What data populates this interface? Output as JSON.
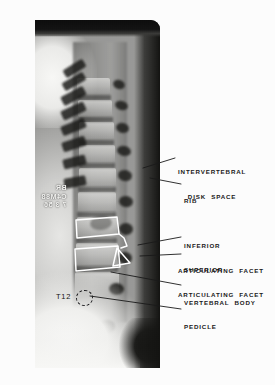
{
  "figure": {
    "type": "annotated-radiograph",
    "view": "lateral thoracolumbar spine",
    "film_stamp": "BR\nC4M88\n7 3 56",
    "on_film_markers": [
      {
        "name": "vertebra-level-marker",
        "text": "T12"
      }
    ],
    "annotations": [
      {
        "id": "intervertebral-disk-space",
        "lines": [
          "INTERVERTEBRAL",
          "DISK  SPACE"
        ],
        "align": "center",
        "text_x": 178,
        "text_y": 152,
        "leader": {
          "x1": 175,
          "y1": 158,
          "x2": 143,
          "y2": 168
        }
      },
      {
        "id": "rib",
        "lines": [
          "RIB"
        ],
        "align": "left",
        "text_x": 184,
        "text_y": 181,
        "leader": {
          "x1": 181,
          "y1": 184,
          "x2": 150,
          "y2": 178
        }
      },
      {
        "id": "inferior-articulating-facet",
        "lines": [
          "INFERIOR",
          "ARTICULATING  FACET"
        ],
        "align": "left",
        "text_x": 184,
        "text_y": 226,
        "leader": {
          "x1": 181,
          "y1": 237,
          "x2": 138,
          "y2": 245
        }
      },
      {
        "id": "superior-articulating-facet",
        "lines": [
          "SUPERIOR",
          "ARTICULATING  FACET"
        ],
        "align": "left",
        "text_x": 184,
        "text_y": 250,
        "leader": {
          "x1": 181,
          "y1": 254,
          "x2": 140,
          "y2": 256
        }
      },
      {
        "id": "vertebral-body",
        "lines": [
          "VERTEBRAL  BODY"
        ],
        "align": "left",
        "text_x": 184,
        "text_y": 283,
        "leader": {
          "x1": 181,
          "y1": 285,
          "x2": 111,
          "y2": 272
        }
      },
      {
        "id": "pedicle",
        "lines": [
          "PEDICLE"
        ],
        "align": "left",
        "text_x": 184,
        "text_y": 307,
        "leader": {
          "x1": 181,
          "y1": 309,
          "x2": 90,
          "y2": 296
        }
      }
    ],
    "colors": {
      "page_background": "#fcfcfc",
      "label_text": "#191919",
      "leader_line": "#1a1a1a",
      "overlay_trace": "#ffffff",
      "film_dark": "#121210",
      "film_light": "#f4f4f2"
    }
  }
}
